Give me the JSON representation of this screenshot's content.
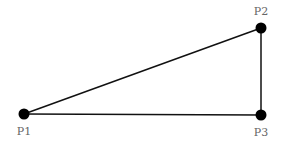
{
  "diagram": {
    "type": "right-triangle",
    "points": [
      {
        "id": "P1",
        "label": "P1",
        "x": 24,
        "y": 114
      },
      {
        "id": "P2",
        "label": "P2",
        "x": 261,
        "y": 28
      },
      {
        "id": "P3",
        "label": "P3",
        "x": 261,
        "y": 115
      }
    ],
    "edges": [
      [
        "P1",
        "P2"
      ],
      [
        "P2",
        "P3"
      ],
      [
        "P1",
        "P3"
      ]
    ],
    "colors": {
      "line": "#111111",
      "point": "#000000",
      "label": "#666666",
      "background": "#ffffff"
    }
  }
}
